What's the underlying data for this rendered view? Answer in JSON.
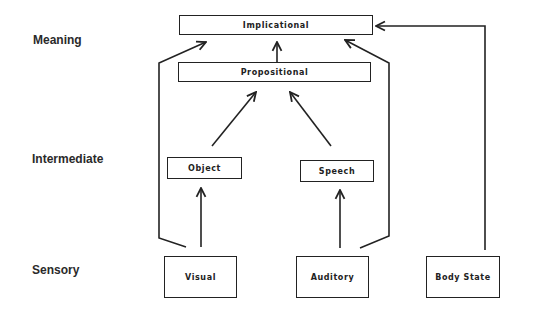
{
  "levels": {
    "meaning": "Meaning",
    "intermediate": "Intermediate",
    "sensory": "Sensory"
  },
  "boxes": {
    "implicational": "Implicational",
    "propositional": "Propositional",
    "object": "Object",
    "speech": "Speech",
    "visual": "Visual",
    "auditory": "Auditory",
    "body_state": "Body State"
  },
  "edges": [
    {
      "from": "visual",
      "to": "object"
    },
    {
      "from": "auditory",
      "to": "speech"
    },
    {
      "from": "object",
      "to": "propositional"
    },
    {
      "from": "speech",
      "to": "propositional"
    },
    {
      "from": "propositional",
      "to": "implicational"
    },
    {
      "from": "visual",
      "to": "implicational"
    },
    {
      "from": "auditory",
      "to": "implicational"
    },
    {
      "from": "body_state",
      "to": "implicational"
    }
  ]
}
